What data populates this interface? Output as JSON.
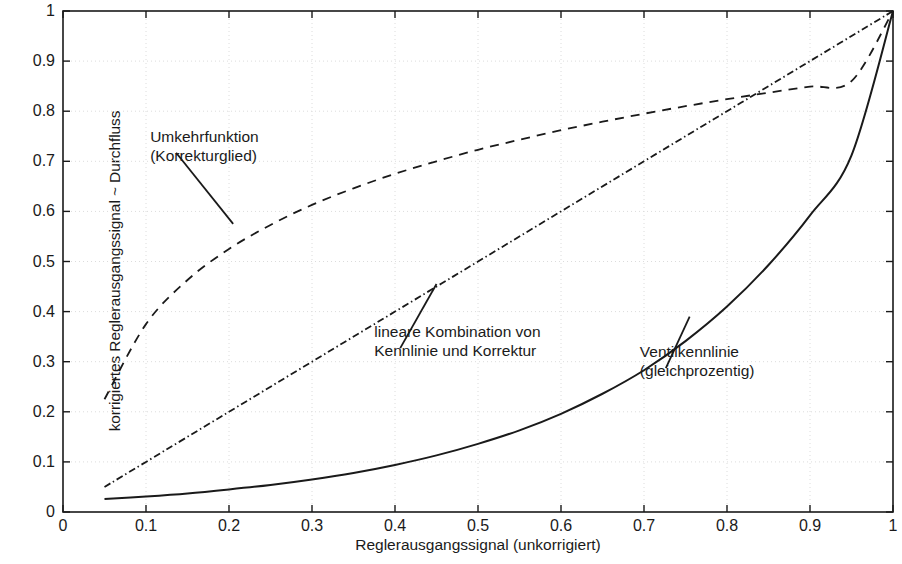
{
  "chart_data": {
    "type": "line",
    "title": "",
    "xlabel": "Reglerausgangssignal (unkorrigiert)",
    "ylabel": "korrigiertes Reglerausgangssignal ~ Durchfluss",
    "xlim": [
      0,
      1
    ],
    "ylim": [
      0,
      1
    ],
    "xticks": [
      "0",
      "0.1",
      "0.2",
      "0.3",
      "0.4",
      "0.5",
      "0.6",
      "0.7",
      "0.8",
      "0.9",
      "1"
    ],
    "yticks": [
      "0",
      "0.1",
      "0.2",
      "0.3",
      "0.4",
      "0.5",
      "0.6",
      "0.7",
      "0.8",
      "0.9",
      "1"
    ],
    "grid": true,
    "legend_position": "none",
    "line_color": "#1a1a1a",
    "grid_color": "#dcdcdc",
    "axis_color": "#1a1a1a",
    "series": [
      {
        "name": "Ventilkennlinie (gleichprozentig)",
        "style": "solid",
        "x": [
          0.05,
          0.1,
          0.15,
          0.2,
          0.25,
          0.3,
          0.35,
          0.4,
          0.45,
          0.5,
          0.55,
          0.6,
          0.65,
          0.7,
          0.75,
          0.8,
          0.85,
          0.9,
          0.95,
          1.0
        ],
        "values": [
          0.026,
          0.031,
          0.037,
          0.045,
          0.054,
          0.065,
          0.078,
          0.094,
          0.113,
          0.136,
          0.163,
          0.196,
          0.236,
          0.283,
          0.341,
          0.41,
          0.493,
          0.592,
          0.712,
          1.0
        ]
      },
      {
        "name": "Umkehrfunktion (Korrekturglied)",
        "style": "dashed",
        "x": [
          0.05,
          0.1,
          0.15,
          0.2,
          0.25,
          0.3,
          0.35,
          0.4,
          0.45,
          0.5,
          0.55,
          0.6,
          0.65,
          0.7,
          0.75,
          0.8,
          0.85,
          0.9,
          0.95,
          1.0
        ],
        "values": [
          0.225,
          0.375,
          0.463,
          0.525,
          0.573,
          0.613,
          0.646,
          0.675,
          0.7,
          0.723,
          0.743,
          0.762,
          0.779,
          0.795,
          0.81,
          0.824,
          0.837,
          0.849,
          0.86,
          1.0
        ]
      },
      {
        "name": "lineare Kombination von Kennlinie und Korrektur",
        "style": "dashdot",
        "x": [
          0.05,
          0.1,
          0.2,
          0.3,
          0.4,
          0.5,
          0.6,
          0.7,
          0.8,
          0.9,
          1.0
        ],
        "values": [
          0.05,
          0.1,
          0.2,
          0.3,
          0.4,
          0.5,
          0.6,
          0.7,
          0.8,
          0.9,
          1.0
        ]
      }
    ],
    "annotations": [
      {
        "id": "annotation-umkehrfunktion",
        "line1": "Umkehrfunktion",
        "line2": "(Korrekturglied)",
        "text_x": 0.105,
        "text_y": 0.745,
        "point_x": 0.205,
        "point_y": 0.575
      },
      {
        "id": "annotation-lineare-kombination",
        "line1": "lineare Kombination von",
        "line2": "Kennlinie und Korrektur",
        "text_x": 0.375,
        "text_y": 0.355,
        "point_x": 0.45,
        "point_y": 0.455
      },
      {
        "id": "annotation-ventilkennlinie",
        "line1": "Ventilkennlinie",
        "line2": "(gleichprozentig)",
        "text_x": 0.695,
        "text_y": 0.315,
        "point_x": 0.755,
        "point_y": 0.39
      }
    ]
  }
}
